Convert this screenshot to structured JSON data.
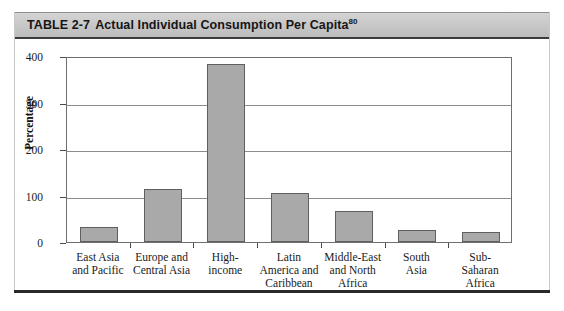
{
  "title": {
    "label": "TABLE 2-7",
    "text": "Actual Individual Consumption Per Capita",
    "footnote": "80"
  },
  "chart_data": {
    "type": "bar",
    "title": "Actual Individual Consumption Per Capita",
    "xlabel": "",
    "ylabel": "Percentage",
    "ylim": [
      0,
      400
    ],
    "yticks": [
      0,
      100,
      200,
      300,
      400
    ],
    "grid": true,
    "legend": "none",
    "bar_color": "#a9a9a9",
    "bar_edge_color": "#5f5f5f",
    "categories": [
      "East Asia and Pacific",
      "Europe and Central Asia",
      "High-income",
      "Latin America and Caribbean",
      "Middle-East and North Africa",
      "South Asia",
      "Sub-Saharan Africa"
    ],
    "category_lines": [
      [
        "East Asia",
        "and Pacific"
      ],
      [
        "Europe and",
        "Central Asia"
      ],
      [
        "High-",
        "income"
      ],
      [
        "Latin",
        "America and",
        "Caribbean"
      ],
      [
        "Middle-East",
        "and North",
        "Africa"
      ],
      [
        "South",
        "Asia"
      ],
      [
        "Sub-",
        "Saharan",
        "Africa"
      ]
    ],
    "values": [
      33,
      114,
      383,
      105,
      66,
      25,
      22
    ]
  }
}
